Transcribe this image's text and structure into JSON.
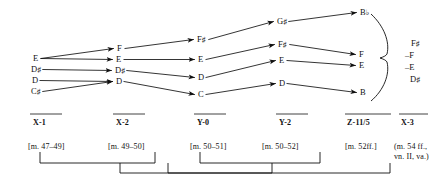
{
  "diagram": {
    "colors": {
      "ink": "#111111",
      "background": "#ffffff"
    },
    "columns": [
      {
        "id": "x1",
        "label": "X-1",
        "measure": "[m. 47–49]"
      },
      {
        "id": "x2",
        "label": "X-2",
        "measure": "[m. 49–50]"
      },
      {
        "id": "y0",
        "label": "Y-0",
        "measure": "[m. 50–51]"
      },
      {
        "id": "y2",
        "label": "Y-2",
        "measure": "[m. 50–52]"
      },
      {
        "id": "z11",
        "label": "Z-11/5",
        "measure": "[m. 52ff.]"
      },
      {
        "id": "x3",
        "label": "X-3",
        "measure_line1": "(m. 54 ff.,",
        "measure_line2": "vn. II, va.)"
      }
    ],
    "nodes": [
      {
        "id": "n_x1_E",
        "col": "x1",
        "letter": "E",
        "accidental": "",
        "x": 33,
        "y": 54
      },
      {
        "id": "n_x1_Ds",
        "col": "x1",
        "letter": "D",
        "accidental": "♯",
        "x": 31,
        "y": 65
      },
      {
        "id": "n_x1_D",
        "col": "x1",
        "letter": "D",
        "accidental": "",
        "x": 32,
        "y": 76
      },
      {
        "id": "n_x1_Cs",
        "col": "x1",
        "letter": "C",
        "accidental": "♯",
        "x": 31,
        "y": 87
      },
      {
        "id": "n_x2_F",
        "col": "x2",
        "letter": "F",
        "accidental": "",
        "x": 117,
        "y": 44
      },
      {
        "id": "n_x2_E",
        "col": "x2",
        "letter": "E",
        "accidental": "",
        "x": 116,
        "y": 55
      },
      {
        "id": "n_x2_Ds",
        "col": "x2",
        "letter": "D",
        "accidental": "♯",
        "x": 115,
        "y": 66
      },
      {
        "id": "n_x2_D",
        "col": "x2",
        "letter": "D",
        "accidental": "",
        "x": 116,
        "y": 77
      },
      {
        "id": "n_y0_Fs",
        "col": "y0",
        "letter": "F",
        "accidental": "♯",
        "x": 197,
        "y": 35
      },
      {
        "id": "n_y0_E",
        "col": "y0",
        "letter": "E",
        "accidental": "",
        "x": 198,
        "y": 55
      },
      {
        "id": "n_y0_D",
        "col": "y0",
        "letter": "D",
        "accidental": "",
        "x": 198,
        "y": 73
      },
      {
        "id": "n_y0_C",
        "col": "y0",
        "letter": "C",
        "accidental": "",
        "x": 198,
        "y": 90
      },
      {
        "id": "n_y2_Gs",
        "col": "y2",
        "letter": "G",
        "accidental": "♯",
        "x": 277,
        "y": 17
      },
      {
        "id": "n_y2_Fs",
        "col": "y2",
        "letter": "F",
        "accidental": "♯",
        "x": 278,
        "y": 40
      },
      {
        "id": "n_y2_E",
        "col": "y2",
        "letter": "E",
        "accidental": "",
        "x": 279,
        "y": 56
      },
      {
        "id": "n_y2_D",
        "col": "y2",
        "letter": "D",
        "accidental": "",
        "x": 279,
        "y": 79
      },
      {
        "id": "n_z_Bb",
        "col": "z11",
        "letter": "B",
        "accidental": "♭",
        "x": 360,
        "y": 8
      },
      {
        "id": "n_z_F",
        "col": "z11",
        "letter": "F",
        "accidental": "",
        "x": 359,
        "y": 50
      },
      {
        "id": "n_z_E",
        "col": "z11",
        "letter": "E",
        "accidental": "",
        "x": 359,
        "y": 61
      },
      {
        "id": "n_z_B",
        "col": "z11",
        "letter": "B",
        "accidental": "",
        "x": 360,
        "y": 88
      }
    ],
    "arrows": [
      {
        "from": "n_x1_E",
        "to": "n_x2_F"
      },
      {
        "from": "n_x1_E",
        "to": "n_x2_E"
      },
      {
        "from": "n_x1_Ds",
        "to": "n_x2_Ds"
      },
      {
        "from": "n_x1_D",
        "to": "n_x2_D"
      },
      {
        "from": "n_x1_Cs",
        "to": "n_x2_D"
      },
      {
        "from": "n_x2_F",
        "to": "n_y0_Fs"
      },
      {
        "from": "n_x2_E",
        "to": "n_y0_E"
      },
      {
        "from": "n_x2_Ds",
        "to": "n_y0_D"
      },
      {
        "from": "n_x2_D",
        "to": "n_y0_C"
      },
      {
        "from": "n_y0_Fs",
        "to": "n_y2_Gs"
      },
      {
        "from": "n_y0_E",
        "to": "n_y2_Fs"
      },
      {
        "from": "n_y0_D",
        "to": "n_y2_E"
      },
      {
        "from": "n_y0_C",
        "to": "n_y2_D"
      },
      {
        "from": "n_y2_Gs",
        "to": "n_z_Bb"
      },
      {
        "from": "n_y2_Fs",
        "to": "n_z_F"
      },
      {
        "from": "n_y2_E",
        "to": "n_z_E"
      },
      {
        "from": "n_y2_D",
        "to": "n_z_B"
      }
    ],
    "brace_notes": [
      {
        "id": "bn_fs",
        "prefix": "",
        "letter": "F",
        "accidental": "♯",
        "x": 411,
        "y": 38
      },
      {
        "id": "bn_f",
        "prefix": "–",
        "letter": "F",
        "accidental": "",
        "x": 405,
        "y": 50
      },
      {
        "id": "bn_e",
        "prefix": "–",
        "letter": "E",
        "accidental": "",
        "x": 405,
        "y": 62
      },
      {
        "id": "bn_ds",
        "prefix": "",
        "letter": "D",
        "accidental": "♯",
        "x": 410,
        "y": 74
      }
    ]
  }
}
